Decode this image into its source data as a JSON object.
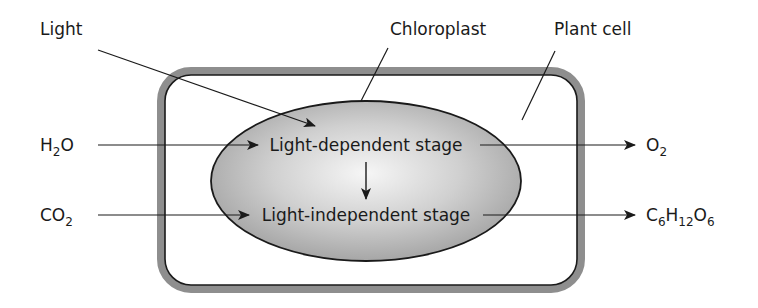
{
  "diagram": {
    "labels": {
      "light": "Light",
      "chloroplast": "Chloroplast",
      "plant_cell": "Plant cell"
    },
    "inputs": {
      "water": {
        "base": "H",
        "sub1": "2",
        "rest": "O"
      },
      "carbon_dioxide": {
        "base": "CO",
        "sub1": "2"
      }
    },
    "outputs": {
      "oxygen": {
        "base": "O",
        "sub1": "2"
      },
      "glucose": {
        "c": "C",
        "c_sub": "6",
        "h": "H",
        "h_sub": "12",
        "o": "O",
        "o_sub": "6"
      }
    },
    "stages": {
      "stage1": "Light-dependent stage",
      "stage2": "Light-independent stage"
    },
    "colors": {
      "cell_border_outer": "#8a8a8a",
      "cell_border_inner": "#1a1a1a",
      "chloroplast_center": "#f4f4f4",
      "chloroplast_edge": "#a8a8a8",
      "line": "#1a1a1a"
    }
  }
}
